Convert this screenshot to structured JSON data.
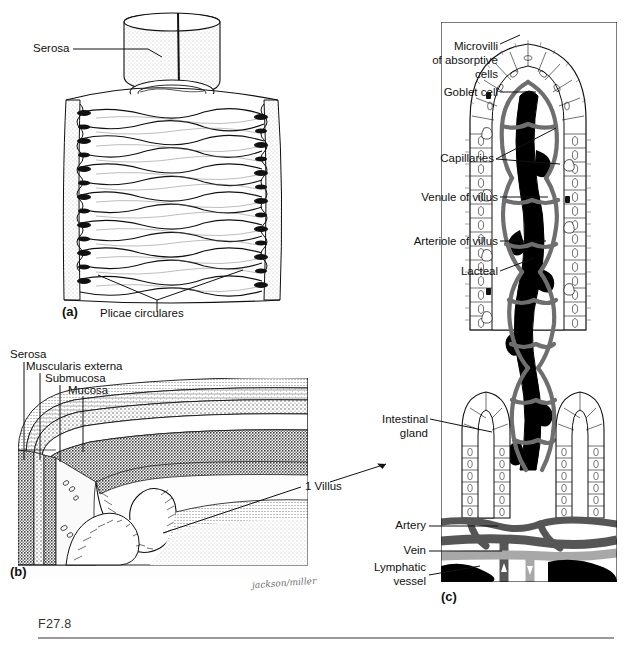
{
  "figure": {
    "id": "F27.8",
    "signature": "jackson/miller"
  },
  "panel_a": {
    "id": "(a)",
    "labels": [
      {
        "name": "serosa",
        "text": "Serosa"
      },
      {
        "name": "plicae-circulares",
        "text": "Plicae circulares"
      }
    ]
  },
  "panel_b": {
    "id": "(b)",
    "labels": [
      {
        "name": "serosa",
        "text": "Serosa"
      },
      {
        "name": "muscularis-externa",
        "text": "Muscularis externa"
      },
      {
        "name": "submucosa",
        "text": "Submucosa"
      },
      {
        "name": "mucosa",
        "text": "Mucosa"
      },
      {
        "name": "one-villus",
        "text": "1 Villus"
      }
    ]
  },
  "panel_c": {
    "id": "(c)",
    "labels": [
      {
        "name": "microvilli",
        "line1": "Microvilli",
        "line2": "of absorptive",
        "line3": "cells"
      },
      {
        "name": "goblet-cell",
        "text": "Goblet cell"
      },
      {
        "name": "capillaries",
        "text": "Capillaries"
      },
      {
        "name": "venule-of-villus",
        "text": "Venule of villus"
      },
      {
        "name": "arteriole-of-villus",
        "text": "Arteriole of villus"
      },
      {
        "name": "lacteal",
        "text": "Lacteal"
      },
      {
        "name": "intestinal-gland",
        "line1": "Intestinal",
        "line2": "gland"
      },
      {
        "name": "artery",
        "text": "Artery"
      },
      {
        "name": "vein",
        "text": "Vein"
      },
      {
        "name": "lymphatic-vessel",
        "line1": "Lymphatic",
        "line2": "vessel"
      }
    ]
  },
  "colors": {
    "ink": "#111111",
    "artery": "#565656",
    "vein": "#a8a8a8",
    "lymphatic": "#000000",
    "tissue_fill": "#f2f2f2",
    "rule": "#9a9a9a"
  }
}
